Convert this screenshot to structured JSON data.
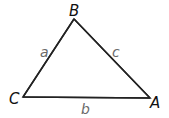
{
  "diagram": {
    "type": "triangle",
    "vertices": [
      {
        "name": "B",
        "x": 74,
        "y": 19
      },
      {
        "name": "C",
        "x": 23,
        "y": 97
      },
      {
        "name": "A",
        "x": 150,
        "y": 98
      }
    ],
    "vertex_labels": {
      "A": "A",
      "B": "B",
      "C": "C"
    },
    "side_labels": {
      "a": "a",
      "b": "b",
      "c": "c"
    },
    "colors": {
      "line": "#222222",
      "vertex_label": "#111111",
      "side_label": "#6a6a6a"
    }
  }
}
